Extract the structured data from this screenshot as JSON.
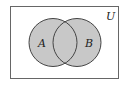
{
  "diagram": {
    "type": "venn",
    "universe_label": "U",
    "sets": [
      {
        "label": "A"
      },
      {
        "label": "B"
      }
    ],
    "fill_color": "#c8c8c8",
    "stroke_color": "#444444",
    "border_color": "#555555",
    "shaded_region": "A union B"
  }
}
